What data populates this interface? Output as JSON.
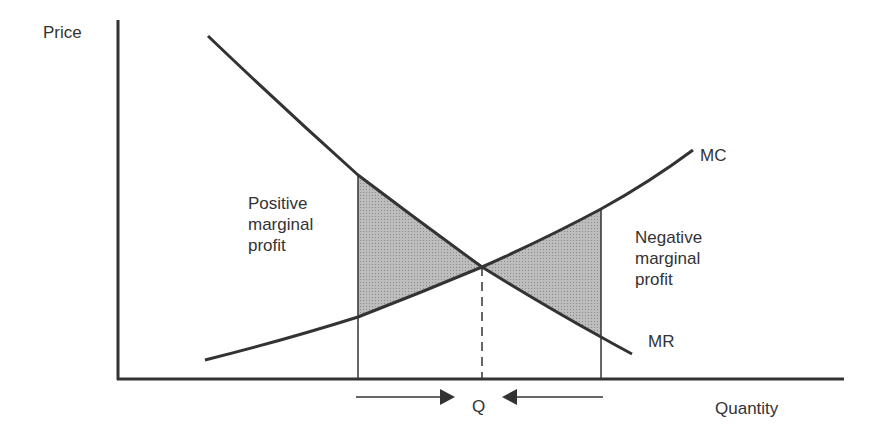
{
  "diagram": {
    "title": "",
    "axes": {
      "y_label": "Price",
      "x_label": "Quantity"
    },
    "curves": [
      {
        "name": "MC",
        "label": "MC",
        "shape": "increasing convex"
      },
      {
        "name": "MR",
        "label": "MR",
        "shape": "decreasing"
      }
    ],
    "regions": [
      {
        "name": "positive",
        "label": "Positive\nmarginal\nprofit",
        "fill": "#b0b0b0"
      },
      {
        "name": "negative",
        "label": "Negative\nmarginal\nprofit",
        "fill": "#b0b0b0"
      }
    ],
    "equilibrium": {
      "label": "Q"
    },
    "colors": {
      "line": "#333333",
      "shade": "#b3b3b3",
      "text": "#333333",
      "background": "#ffffff"
    }
  }
}
